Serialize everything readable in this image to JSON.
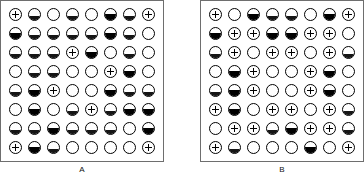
{
  "figure": {
    "title": "",
    "panels": [
      {
        "id": "A",
        "label": "A",
        "rows": 8,
        "cols": 8,
        "grid": [
          [
            "plus",
            "half",
            "empty",
            "half",
            "empty",
            "dark",
            "half",
            "plus"
          ],
          [
            "dark",
            "half",
            "half",
            "half",
            "half",
            "dark",
            "half",
            "empty"
          ],
          [
            "half",
            "half",
            "half",
            "plus",
            "dark",
            "empty",
            "half",
            "empty"
          ],
          [
            "empty",
            "half",
            "half",
            "empty",
            "empty",
            "plus",
            "dark",
            "empty"
          ],
          [
            "half",
            "dark",
            "plus",
            "empty",
            "empty",
            "dark",
            "half",
            "half"
          ],
          [
            "empty",
            "dark",
            "empty",
            "half",
            "plus",
            "half",
            "dark",
            "dark"
          ],
          [
            "half",
            "half",
            "dark",
            "half",
            "half",
            "half",
            "empty",
            "dark"
          ],
          [
            "plus",
            "dark",
            "half",
            "empty",
            "empty",
            "empty",
            "empty",
            "plus"
          ]
        ]
      },
      {
        "id": "B",
        "label": "B",
        "rows": 8,
        "cols": 8,
        "grid": [
          [
            "plus",
            "empty",
            "dark",
            "half",
            "half",
            "empty",
            "dark",
            "plus"
          ],
          [
            "dark",
            "plus",
            "plus",
            "dark",
            "dark",
            "plus",
            "plus",
            "empty"
          ],
          [
            "half",
            "plus",
            "empty",
            "plus",
            "plus",
            "empty",
            "plus",
            "half"
          ],
          [
            "empty",
            "dark",
            "plus",
            "empty",
            "empty",
            "plus",
            "dark",
            "empty"
          ],
          [
            "half",
            "dark",
            "plus",
            "empty",
            "empty",
            "plus",
            "dark",
            "empty"
          ],
          [
            "plus",
            "dark",
            "empty",
            "plus",
            "plus",
            "empty",
            "plus",
            "half"
          ],
          [
            "empty",
            "plus",
            "plus",
            "half",
            "dark",
            "plus",
            "plus",
            "half"
          ],
          [
            "plus",
            "half",
            "empty",
            "empty",
            "empty",
            "dark",
            "empty",
            "plus"
          ]
        ]
      }
    ],
    "legend_symbols": {
      "empty": "open-circle",
      "half": "half-filled-circle",
      "dark": "filled-circle",
      "plus": "plus-in-circle"
    },
    "colors": {
      "fill": "#000000",
      "frame": "#6e6e6e",
      "background": "#ffffff",
      "label": "#111111"
    }
  }
}
